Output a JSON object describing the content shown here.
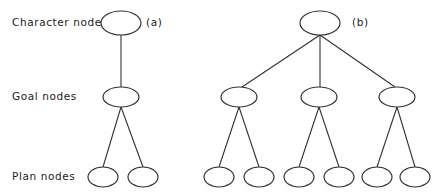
{
  "row_labels": {
    "character": "Character nodes",
    "goal": "Goal nodes",
    "plan": "Plan nodes"
  },
  "panels": {
    "a": {
      "tag": "(a)"
    },
    "b": {
      "tag": "(b)"
    }
  },
  "colors": {
    "stroke": "#333333",
    "background": "#ffffff"
  }
}
